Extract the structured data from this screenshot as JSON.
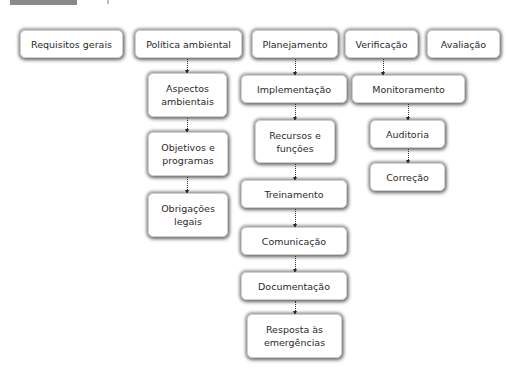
{
  "colors": {
    "box_bg": "#ffffff",
    "text": "#2b2b2b",
    "arrow": "#333333",
    "caption_bar": "#8a8a8a"
  },
  "top_row": [
    {
      "id": "requisitos",
      "label": "Requisitos gerais"
    },
    {
      "id": "politica",
      "label": "Política ambiental"
    },
    {
      "id": "planejamento",
      "label": "Planejamento"
    },
    {
      "id": "verificacao",
      "label": "Verificação"
    },
    {
      "id": "avaliacao",
      "label": "Avaliação"
    }
  ],
  "politica_children": [
    {
      "label": "Aspectos ambientais"
    },
    {
      "label": "Objetivos e programas"
    },
    {
      "label": "Obrigações legais"
    }
  ],
  "planejamento_children": [
    {
      "label": "Implementação"
    },
    {
      "label": "Recursos e funções"
    },
    {
      "label": "Treinamento"
    },
    {
      "label": "Comunicação"
    },
    {
      "label": "Documentação"
    },
    {
      "label": "Resposta às emergências"
    }
  ],
  "verificacao_children": [
    {
      "label": "Monitoramento"
    },
    {
      "label": "Auditoria"
    },
    {
      "label": "Correção"
    }
  ]
}
